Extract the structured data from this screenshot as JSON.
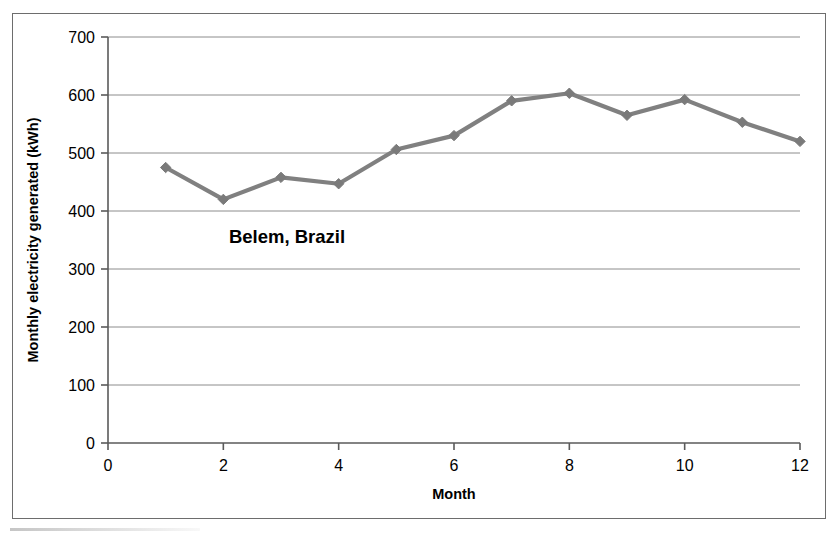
{
  "chart_data": {
    "type": "line",
    "title": "",
    "annotation": "Belem, Brazil",
    "xlabel": "Month",
    "ylabel": "Monthly electricity generated (kWh)",
    "x": [
      1,
      2,
      3,
      4,
      5,
      6,
      7,
      8,
      9,
      10,
      11,
      12
    ],
    "values": [
      475,
      420,
      458,
      447,
      506,
      530,
      590,
      603,
      565,
      592,
      553,
      520
    ],
    "series": [
      {
        "name": "Belem, Brazil",
        "values": [
          475,
          420,
          458,
          447,
          506,
          530,
          590,
          603,
          565,
          592,
          553,
          520
        ]
      }
    ],
    "xlim": [
      0,
      12
    ],
    "ylim": [
      0,
      700
    ],
    "xticks": [
      0,
      2,
      4,
      6,
      8,
      10,
      12
    ],
    "xtick_labels": [
      "0",
      "2",
      "4",
      "6",
      "8",
      "10",
      "12"
    ],
    "yticks": [
      0,
      100,
      200,
      300,
      400,
      500,
      600,
      700
    ],
    "ytick_labels": [
      "0",
      "100",
      "200",
      "300",
      "400",
      "500",
      "600",
      "700"
    ],
    "grid": "horizontal",
    "legend": "none",
    "marker": "diamond",
    "line_color": "#808080",
    "marker_color": "#7a7a7a",
    "grid_color": "#8c8c8c",
    "axis_color": "#5a5a5a"
  }
}
